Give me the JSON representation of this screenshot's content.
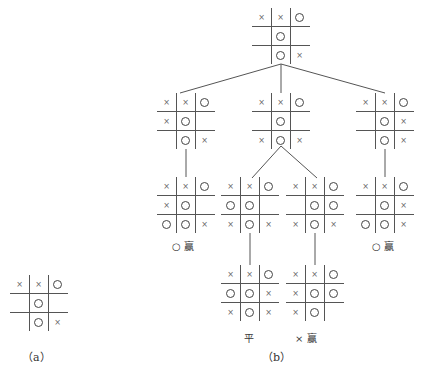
{
  "figure_a": {
    "caption": "（a）",
    "board": [
      "x",
      "x",
      "o",
      "",
      "o",
      "",
      "",
      "o",
      "x"
    ]
  },
  "figure_b": {
    "caption": "（b）",
    "tree": {
      "root": {
        "board": [
          "x",
          "x",
          "o",
          "",
          "o",
          "",
          "",
          "o",
          "x"
        ]
      },
      "level1": [
        {
          "board": [
            "x",
            "x",
            "o",
            "x",
            "o",
            "",
            "",
            "o",
            "x"
          ]
        },
        {
          "board": [
            "x",
            "x",
            "o",
            "",
            "o",
            "",
            "x",
            "o",
            "x"
          ]
        },
        {
          "board": [
            "x",
            "x",
            "o",
            "",
            "o",
            "x",
            "",
            "o",
            "x"
          ]
        }
      ],
      "level2": [
        {
          "board": [
            "x",
            "x",
            "o",
            "x",
            "o",
            "",
            "o",
            "o",
            "x"
          ],
          "result": "○ 赢"
        },
        {
          "board": [
            "x",
            "x",
            "o",
            "o",
            "o",
            "",
            "x",
            "o",
            "x"
          ]
        },
        {
          "board": [
            "x",
            "x",
            "o",
            "",
            "o",
            "o",
            "x",
            "o",
            "x"
          ]
        },
        {
          "board": [
            "x",
            "x",
            "o",
            "",
            "o",
            "x",
            "o",
            "o",
            "x"
          ],
          "result": "○ 赢"
        }
      ],
      "level3": [
        {
          "board": [
            "x",
            "x",
            "o",
            "o",
            "o",
            "x",
            "x",
            "o",
            "x"
          ],
          "result": "平"
        },
        {
          "board": [
            "x",
            "x",
            "o",
            "x",
            "o",
            "o",
            "x",
            "o",
            ""
          ],
          "result": "× 赢"
        }
      ]
    }
  }
}
